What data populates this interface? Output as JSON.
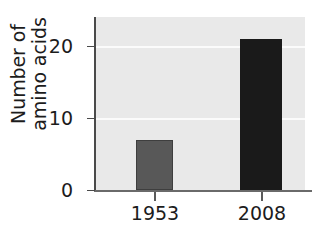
{
  "chart_data": {
    "type": "bar",
    "title": "",
    "xlabel": "",
    "ylabel_line1": "Number of",
    "ylabel_line2": "amino acids",
    "ylabel": "Number of amino acids",
    "categories": [
      "1953",
      "2008"
    ],
    "values": [
      7,
      21
    ],
    "ylim": [
      0,
      24
    ],
    "yticks": [
      0,
      10,
      20
    ],
    "ytick_labels": [
      "0",
      "10",
      "20"
    ],
    "grid": "horizontal-white-at-10-and-20",
    "legend": "none",
    "bar_colors": [
      "#585858",
      "#1a1a1a"
    ],
    "plot_background": "#e9e9e9",
    "axis_color": "#4a4a4a"
  }
}
